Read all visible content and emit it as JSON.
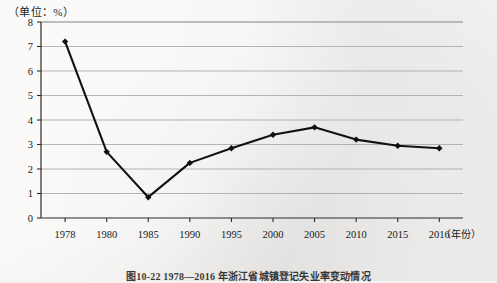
{
  "unit_label": "（单位：%）",
  "caption": "图10-22  1978—2016 年浙江省城镇登记失业率变动情况",
  "axis": {
    "x_unit_label": "（年份）",
    "y_ticks": [
      "0",
      "1",
      "2",
      "3",
      "4",
      "5",
      "6",
      "7",
      "8"
    ],
    "x_ticks": [
      "1978",
      "1980",
      "1985",
      "1990",
      "1995",
      "2000",
      "2005",
      "2010",
      "2015",
      "2016"
    ]
  },
  "colors": {
    "line": "#111111",
    "grid": "#a8a8a8",
    "axis": "#2a2a2a",
    "paper": "#f3f2f0"
  },
  "chart_data": {
    "type": "line",
    "title": "图10-22  1978—2016 年浙江省城镇登记失业率变动情况",
    "xlabel": "（年份）",
    "ylabel": "（单位：%）",
    "categories": [
      "1978",
      "1980",
      "1985",
      "1990",
      "1995",
      "2000",
      "2005",
      "2010",
      "2015",
      "2016"
    ],
    "values": [
      7.2,
      2.7,
      0.85,
      2.25,
      2.85,
      3.4,
      3.7,
      3.2,
      2.95,
      2.85
    ],
    "ylim": [
      0,
      8
    ],
    "ytick_step": 1,
    "grid": true,
    "legend": "none",
    "markers": true
  }
}
